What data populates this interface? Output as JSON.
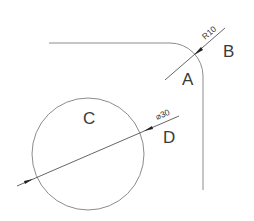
{
  "diagram": {
    "labels": {
      "a": "A",
      "b": "B",
      "c": "C",
      "d": "D"
    },
    "dimensions": {
      "radius": "R10",
      "diameter": "⌀30"
    },
    "colors": {
      "line": "#8c8c8c",
      "leader": "#555555",
      "text": "#3a3a3a"
    }
  }
}
